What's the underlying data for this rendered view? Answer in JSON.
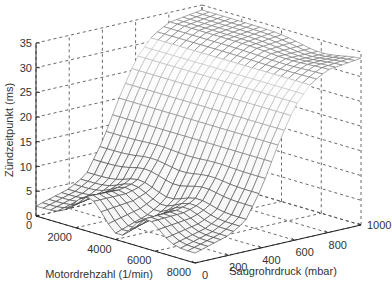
{
  "chart_data": {
    "type": "surface3d",
    "title": "",
    "xlabel": "Motordrehzahl (1/min)",
    "ylabel": "Saugrohrdruck (mbar)",
    "zlabel": "Zündzeitpunkt (ms)",
    "x_ticks": [
      0,
      2000,
      4000,
      6000,
      8000
    ],
    "y_ticks": [
      0,
      200,
      400,
      600,
      800,
      1000
    ],
    "z_ticks": [
      0,
      5,
      10,
      15,
      20,
      25,
      30,
      35
    ],
    "xlim": [
      0,
      8000
    ],
    "ylim": [
      0,
      1000
    ],
    "zlim": [
      0,
      35
    ],
    "grid": true,
    "grid_style": "dashed",
    "legend": null,
    "mesh_color": "#555555",
    "surface_description": "Ignition timing map: low values (~2-5 ms) at low intake manifold pressure with local bumps near 2000-3000 and 5000-6000 rpm, rising steeply between ~300 and ~600 mbar, plateau ~32-34 ms at high pressure across all speeds",
    "approx_profile_vs_pressure": {
      "pressure_mbar": [
        0,
        100,
        200,
        300,
        400,
        500,
        600,
        700,
        800,
        900,
        1000
      ],
      "z_ms": [
        2,
        3,
        4,
        6,
        12,
        20,
        27,
        31,
        33,
        33.5,
        34
      ]
    }
  },
  "axes": {
    "z_tick_labels": [
      "0",
      "5",
      "10",
      "15",
      "20",
      "25",
      "30",
      "35"
    ],
    "x_tick_labels": [
      "0",
      "2000",
      "4000",
      "6000",
      "8000"
    ],
    "y_tick_labels": [
      "0",
      "200",
      "400",
      "600",
      "800",
      "1000"
    ],
    "xlabel": "Motordrehzahl (1/min)",
    "ylabel": "Saugrohrdruck (mbar)",
    "zlabel": "Zündzeitpunkt (ms)"
  }
}
